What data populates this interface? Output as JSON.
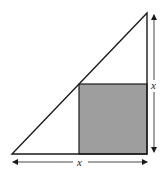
{
  "diagram": {
    "labels": {
      "vertical_dimension": "x",
      "horizontal_dimension": "x"
    },
    "colors": {
      "stroke": "#1a1a1a",
      "square_fill": "#9e9e9e",
      "background": "#ffffff"
    }
  }
}
